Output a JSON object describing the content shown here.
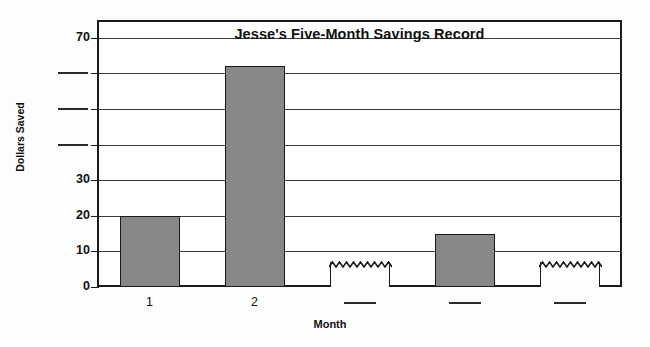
{
  "chart_data": {
    "type": "bar",
    "title": "Jesse's Five-Month Savings Record",
    "xlabel": "Month",
    "ylabel": "Dollars Saved",
    "categories": [
      "1",
      "2",
      "",
      "",
      ""
    ],
    "values": [
      20,
      62,
      7,
      15,
      7
    ],
    "ylim": [
      0,
      75
    ],
    "grid": true,
    "legend": "none",
    "y_ticks": [
      {
        "value": 0,
        "label": "0",
        "blank": false
      },
      {
        "value": 10,
        "label": "10",
        "blank": false
      },
      {
        "value": 20,
        "label": "20",
        "blank": false
      },
      {
        "value": 30,
        "label": "30",
        "blank": false
      },
      {
        "value": 40,
        "label": "",
        "blank": true
      },
      {
        "value": 50,
        "label": "",
        "blank": true
      },
      {
        "value": 60,
        "label": "",
        "blank": true
      },
      {
        "value": 70,
        "label": "70",
        "blank": false
      }
    ],
    "x_ticks": [
      {
        "label": "1",
        "blank": false
      },
      {
        "label": "2",
        "blank": false
      },
      {
        "label": "",
        "blank": true
      },
      {
        "label": "",
        "blank": true
      },
      {
        "label": "",
        "blank": true
      }
    ],
    "bars": [
      {
        "category": "1",
        "value": 20,
        "style": "filled",
        "fill": "#878787"
      },
      {
        "category": "2",
        "value": 62,
        "style": "filled",
        "fill": "#878787"
      },
      {
        "category": "",
        "value": 7,
        "style": "open-wavy",
        "fill": "#ffffff"
      },
      {
        "category": "",
        "value": 15,
        "style": "filled",
        "fill": "#878787"
      },
      {
        "category": "",
        "value": 7,
        "style": "open-wavy",
        "fill": "#ffffff"
      }
    ],
    "colors": {
      "bar_fill": "#878787",
      "bar_stroke": "#1a1a1a",
      "gridline": "#3a3a3a",
      "frame": "#1a1a1a",
      "background": "#ffffff",
      "text": "#111111"
    },
    "annotations": [
      "Bars 3 and 5 are drawn open (unfilled) with a jagged/wavy top edge indicating values to be filled in.",
      "Y-axis tick labels for 40, 50 and 60 are replaced by blank answer rules.",
      "X-axis tick labels for months 3, 4 and 5 are replaced by blank answer rules."
    ]
  }
}
